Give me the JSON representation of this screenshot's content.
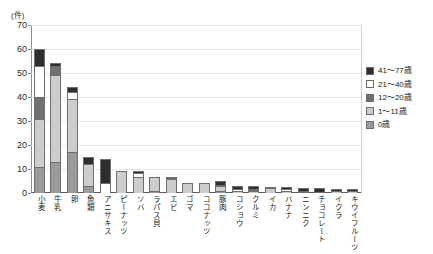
{
  "chart_data": {
    "type": "bar",
    "stacked": true,
    "title": "",
    "subtitle": "",
    "xlabel": "",
    "ylabel": "(件)",
    "unit_label": "(件)",
    "ylim": [
      0,
      70
    ],
    "yticks": [
      0,
      10,
      20,
      30,
      40,
      50,
      60,
      70
    ],
    "ytick_labels": [
      "0",
      "10",
      "20",
      "30",
      "40",
      "50",
      "60",
      "70"
    ],
    "grid": true,
    "legend_position": "right",
    "categories": [
      "小麦",
      "牛乳",
      "卵",
      "魚類",
      "アニサキス",
      "ピーナッツ",
      "ソバ",
      "ラパス貝",
      "エビ",
      "ゴマ",
      "ココナッツ",
      "豚肉",
      "コショウ",
      "クルミ",
      "イカ",
      "バナナ",
      "ニンニク",
      "チョコレート",
      "イクラ",
      "キウイフルーツ"
    ],
    "series": [
      {
        "name": "0歳",
        "color": "#9a9a9a",
        "values": [
          11,
          13,
          17,
          3,
          0,
          0,
          0,
          1,
          0,
          0,
          0,
          1,
          0,
          0,
          0,
          0,
          0,
          0,
          0,
          0
        ]
      },
      {
        "name": "1～11歳",
        "color": "#cdcdcd",
        "values": [
          20,
          36,
          22,
          9,
          0,
          9,
          6.5,
          5.5,
          6,
          4,
          4,
          2,
          1,
          1,
          2,
          1,
          0,
          0,
          1,
          1
        ]
      },
      {
        "name": "12～20歳",
        "color": "#707070",
        "values": [
          9,
          4,
          0,
          0,
          0,
          0,
          0,
          0,
          0.5,
          0,
          0,
          0,
          0,
          0.5,
          0,
          0,
          0.5,
          0,
          0,
          0
        ]
      },
      {
        "name": "21～40歳",
        "color": "#ffffff",
        "values": [
          13,
          0,
          3,
          0,
          4,
          0,
          2,
          0,
          0,
          0,
          0,
          0.5,
          0.5,
          0,
          0,
          0.5,
          0.5,
          0.5,
          0,
          0
        ]
      },
      {
        "name": "41～77歳",
        "color": "#2e2e2e",
        "values": [
          7,
          1,
          2,
          3,
          10,
          0,
          0.5,
          0,
          0,
          0,
          0,
          1.5,
          1.5,
          1.5,
          0.5,
          1,
          1,
          1.5,
          0.5,
          0.5
        ]
      }
    ],
    "stack_order_bottom_to_top": [
      "0歳",
      "1～11歳",
      "12～20歳",
      "21～40歳",
      "41～77歳"
    ],
    "totals": [
      60,
      54,
      44,
      15,
      14,
      9,
      9,
      6.5,
      6.5,
      4,
      4,
      5,
      3,
      3,
      2.5,
      2.5,
      2,
      2,
      1.5,
      1.5
    ]
  },
  "legend": {
    "items": [
      {
        "label": "41～77歳",
        "color": "#2e2e2e"
      },
      {
        "label": "21～40歳",
        "color": "#ffffff"
      },
      {
        "label": "12～20歳",
        "color": "#707070"
      },
      {
        "label": "1～11歳",
        "color": "#cdcdcd"
      },
      {
        "label": "0歳",
        "color": "#9a9a9a"
      }
    ]
  }
}
